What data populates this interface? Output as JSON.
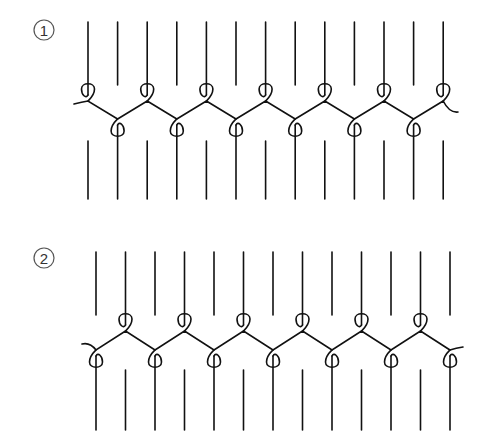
{
  "figures": [
    {
      "label": "1",
      "label_center": [
        44,
        30
      ],
      "line_count": 13,
      "first_line_x": 88,
      "line_spacing": 29.6,
      "upper_loop_parity": "even",
      "top_line_y": [
        22,
        85
      ],
      "bottom_line_y": [
        141,
        199
      ],
      "upper_crossing_y": 101,
      "lower_crossing_y": 119,
      "left_tail": [
        74,
        104
      ],
      "right_tail": [
        458,
        112
      ]
    },
    {
      "label": "2",
      "label_center": [
        44,
        258
      ],
      "line_count": 13,
      "first_line_x": 96,
      "line_spacing": 29.5,
      "upper_loop_parity": "odd",
      "top_line_y": [
        252,
        315
      ],
      "bottom_line_y": [
        370,
        430
      ],
      "upper_crossing_y": 331,
      "lower_crossing_y": 350,
      "left_tail": [
        82,
        344
      ],
      "right_tail": [
        463,
        347
      ]
    }
  ],
  "colors": {
    "stroke": "#111111",
    "label": "#333333",
    "background": "#ffffff"
  }
}
